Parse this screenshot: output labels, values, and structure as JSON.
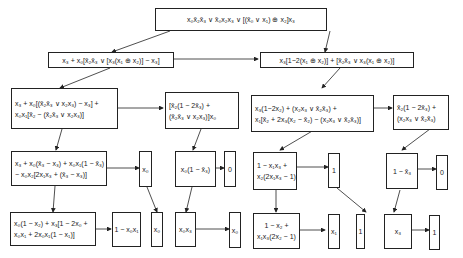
{
  "diagram": {
    "type": "decision-tree / function decomposition",
    "nodes": {
      "root": {
        "lines": [
          "x₀x̄₂x̄₃ ∨ x̄₀x₂x₃ ∨ [(x̄₀ ∨ x₁) ⊕ x₂]x₃"
        ]
      },
      "l1_left": {
        "lines": [
          "x₃ + x₀[x̄₂x̄₃ ∨ [x₃(x₁ ⊕ x₂)] − x₃]"
        ]
      },
      "l1_right": {
        "lines": [
          "x₃[1−2(x₁ ⊕ x₂)] + [x̄₂x̄₃ ∨ x₃(x₁ ⊕ x₂)]"
        ]
      },
      "l2_a": {
        "lines": [
          "x₃ + x₀[(x̄₂x̄₃ ∨ x₂x₃) − x₃] +",
          "x₀x₁[x̄₂ − (x̄₂x̄₃ ∨ x₂x₃)]"
        ]
      },
      "l2_b": {
        "lines": [
          "[x̄₂(1 − 2x̄₃) +",
          "(x̄₂x̄₃ ∨ x₂x₃)]x₀"
        ]
      },
      "l2_c": {
        "lines": [
          "x₃(1−2x₂) + (x₂x₃ ∨ x̄₂x̄₃) +",
          "x₁[x̄₂ + 2x₃(x₂ − x̄₂) − (x₂x₃ ∨ x̄₂x̄₃)]"
        ]
      },
      "l2_d": {
        "lines": [
          "x̄₂(1 − 2x̄₃) +",
          "(x₂x₃ ∨ x̄₂x̄₃)"
        ]
      },
      "l3_a": {
        "lines": [
          "x₃ + x₀(x̄₃ − x₃) + x₀x₁(1 − x̄₃)",
          "− x₀x₂[2x₁x₃ + (x̄₃ − x₃)]"
        ]
      },
      "l3_a_side": {
        "lines": [
          "x₀"
        ]
      },
      "l3_b": {
        "lines": [
          "x₀(1 − x̄₃)"
        ]
      },
      "l3_b_side": {
        "lines": [
          "0"
        ]
      },
      "l3_c": {
        "lines": [
          "1 − x₁x₃ +",
          "x₂(2x₁x₃ − 1)"
        ]
      },
      "l3_c_side": {
        "lines": [
          "1"
        ]
      },
      "l3_d": {
        "lines": [
          "1 − x̄₃"
        ]
      },
      "l3_d_side": {
        "lines": [
          "0"
        ]
      },
      "l4_a": {
        "lines": [
          "x₀(1 − x₂) + x₃[1 − 2x₀ +",
          "x₀x₁ + 2x₀x₁(1 − x₁)]"
        ]
      },
      "l4_a_side": {
        "lines": [
          "1 − x₀x₁"
        ]
      },
      "l4_b": {
        "lines": [
          "x₀"
        ]
      },
      "l4_c": {
        "lines": [
          "x₀x₃"
        ]
      },
      "l4_c_side": {
        "lines": [
          "x₀"
        ]
      },
      "l4_d": {
        "lines": [
          "1 − x₂ +",
          "x₁x₃(2x₂ − 1)"
        ]
      },
      "l4_d_side": {
        "lines": [
          "x₁"
        ]
      },
      "l4_e": {
        "lines": [
          "1"
        ]
      },
      "l4_f": {
        "lines": [
          "x₃"
        ]
      },
      "l4_f_side": {
        "lines": [
          "1"
        ]
      }
    }
  }
}
